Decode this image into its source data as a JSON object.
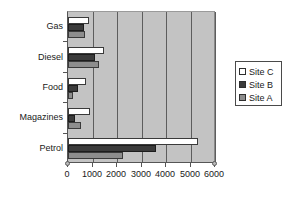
{
  "chart_data": {
    "type": "bar",
    "orientation": "horizontal",
    "title": "",
    "xlabel": "",
    "ylabel": "",
    "categories": [
      "Gas",
      "Diesel",
      "Food",
      "Magazines",
      "Petrol"
    ],
    "series": [
      {
        "name": "Site C",
        "color": "#ffffff",
        "values": [
          870,
          1450,
          750,
          880,
          5300
        ]
      },
      {
        "name": "Site B",
        "color": "#3b3b3b",
        "values": [
          650,
          1100,
          400,
          280,
          3600
        ]
      },
      {
        "name": "Site A",
        "color": "#8d8d8d",
        "values": [
          700,
          1250,
          200,
          550,
          2250
        ]
      }
    ],
    "xlim": [
      0,
      6000
    ],
    "xticks": [
      0,
      1000,
      2000,
      3000,
      4000,
      5000,
      6000
    ],
    "xtick_labels": [
      "0",
      "1000",
      "2000",
      "3000",
      "4000",
      "5000",
      "6000"
    ],
    "grid": true,
    "grid_axis": "x",
    "legend": {
      "position": "right",
      "entries": [
        {
          "label": "Site C",
          "color": "#ffffff"
        },
        {
          "label": "Site B",
          "color": "#3b3b3b"
        },
        {
          "label": "Site A",
          "color": "#8d8d8d"
        }
      ]
    },
    "plot_background": "#c3c3c3"
  }
}
